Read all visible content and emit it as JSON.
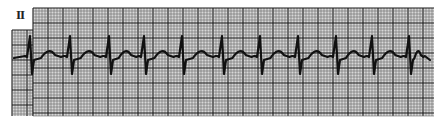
{
  "ecg": {
    "lead_label": "II",
    "colors": {
      "paper": "#ffffff",
      "grid_minor": "#6a6a6a",
      "grid_major": "#1a1a1a",
      "trace": "#111111"
    },
    "grid": {
      "upper_rect": {
        "x": 33,
        "y": 8,
        "w": 401,
        "h": 108
      },
      "lower_rect": {
        "x": 12,
        "y": 30,
        "w": 422,
        "h": 86
      },
      "minor_spacing": 3,
      "major_every": 5
    },
    "baseline_y": 56,
    "r_peaks_x": [
      31,
      71,
      110,
      145,
      183,
      223,
      261,
      299,
      337,
      373,
      410
    ],
    "r_peak_y": 36,
    "s_trough_y": 74,
    "t_wave_peak_y": 46
  }
}
